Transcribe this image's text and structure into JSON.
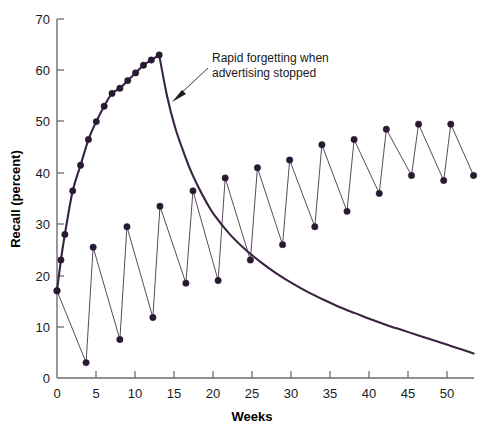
{
  "chart_data": {
    "type": "line",
    "title": "",
    "xlabel": "Weeks",
    "ylabel": "Recall (percent)",
    "xlim": [
      0,
      53
    ],
    "ylim": [
      0,
      70
    ],
    "xticks": [
      0,
      5,
      10,
      15,
      20,
      25,
      30,
      35,
      40,
      45,
      50
    ],
    "yticks": [
      0,
      10,
      20,
      30,
      40,
      50,
      60,
      70
    ],
    "grid": false,
    "legend": null,
    "annotations": [
      {
        "text_line1": "Rapid forgetting when",
        "text_line2": "advertising stopped",
        "points_to_x": 14.5,
        "points_to_y": 54
      }
    ],
    "series": [
      {
        "name": "continuous-advertising-recall",
        "style": "smooth-curve-with-markers-then-decay",
        "markers": true,
        "x": [
          0,
          0.5,
          1,
          2,
          3,
          4,
          5,
          6,
          7,
          8,
          9,
          10,
          11,
          12,
          13
        ],
        "y": [
          17,
          23,
          28,
          36.5,
          41.5,
          46.5,
          50,
          53,
          55.5,
          56.5,
          58,
          59.5,
          61,
          62,
          63
        ],
        "decay_x": [
          13,
          14,
          15,
          16,
          17,
          18,
          19,
          20,
          22,
          24,
          26,
          28,
          30,
          32,
          34,
          36,
          38,
          40,
          42,
          44,
          46,
          48,
          50,
          52,
          53
        ],
        "decay_y": [
          63,
          55,
          49,
          44.5,
          40.5,
          37.2,
          34.3,
          31.8,
          28,
          25,
          22.5,
          20.3,
          18.4,
          16.7,
          15.2,
          13.8,
          12.6,
          11.4,
          10.3,
          9.3,
          8.3,
          7.3,
          6.3,
          5.3,
          4.8
        ]
      },
      {
        "name": "pulsed-advertising-recall",
        "style": "sawtooth-with-markers",
        "markers": true,
        "x": [
          0,
          3.7,
          4.6,
          8.0,
          8.9,
          12.2,
          13.1,
          16.4,
          17.3,
          20.5,
          21.4,
          24.6,
          25.5,
          28.7,
          29.6,
          32.8,
          33.7,
          36.9,
          37.8,
          41.0,
          41.9,
          45.1,
          46.0,
          49.2,
          50.1,
          53.0
        ],
        "y": [
          17,
          3,
          25.5,
          7.5,
          29.5,
          11.8,
          33.5,
          18.5,
          36.5,
          19,
          39,
          23,
          41,
          26,
          42.5,
          29.5,
          45.5,
          32.5,
          46.5,
          36,
          48.5,
          39.5,
          49.5,
          38.5,
          49.5,
          39.5
        ]
      }
    ]
  },
  "axes": {
    "y_title": "Recall (percent)",
    "x_title": "Weeks"
  }
}
